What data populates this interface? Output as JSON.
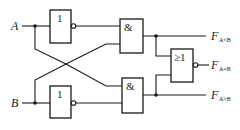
{
  "diagram": {
    "type": "logic-circuit",
    "inputs": [
      {
        "name": "A"
      },
      {
        "name": "B"
      }
    ],
    "gates": [
      {
        "id": "not_a",
        "symbol": "1",
        "kind": "NOT",
        "input": "A"
      },
      {
        "id": "not_b",
        "symbol": "1",
        "kind": "NOT",
        "input": "B"
      },
      {
        "id": "and_top",
        "symbol": "&",
        "kind": "AND",
        "inputs": [
          "NOT A",
          "B"
        ]
      },
      {
        "id": "and_bottom",
        "symbol": "&",
        "kind": "AND",
        "inputs": [
          "A",
          "NOT B"
        ]
      },
      {
        "id": "nor",
        "symbol": "≥1",
        "kind": "NOR",
        "inputs": [
          "and_top",
          "and_bottom"
        ]
      }
    ],
    "outputs": [
      {
        "label": "F",
        "subscript": "A<B",
        "source": "and_top"
      },
      {
        "label": "F",
        "subscript": "A=B",
        "source": "nor"
      },
      {
        "label": "F",
        "subscript": "A>B",
        "source": "and_bottom"
      }
    ]
  }
}
